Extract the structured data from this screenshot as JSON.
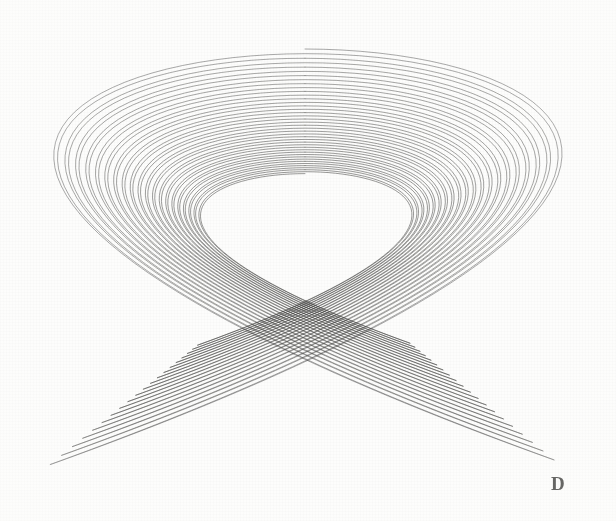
{
  "figure": {
    "label": "D",
    "background_color": "#fdfdfc",
    "ink_color": "#3b3b39",
    "width": 616,
    "height": 521
  },
  "chart_data": {
    "type": "line",
    "subtitle": "",
    "xlabel": "",
    "ylabel": "",
    "annotations": [
      "D"
    ],
    "legend_position": "none",
    "grid": false,
    "xlim": [
      -1.08,
      1.08
    ],
    "ylim": [
      -1.08,
      1.08
    ],
    "axis_visible": false,
    "tick_labels_x": [],
    "tick_labels_y": [],
    "canvas": {
      "center_x": 305,
      "center_y": 258,
      "radius_x": 258,
      "radius_y": 209,
      "bbox": [
        47,
        40,
        563,
        456
      ]
    },
    "parameters": {
      "freq_x": 3.0,
      "freq_y": 2.0,
      "phase_x_deg": 0,
      "phase_y_deg": 90,
      "damping": 0.0042,
      "phase_drift_deg": 0.0,
      "turns": 20,
      "samples_per_turn": 260,
      "line_width": 0.85,
      "stroke_opacity": 0.62
    },
    "series": [
      {
        "name": "pendulum-x",
        "frequency": 3.0,
        "phase_deg": 0,
        "amplitude": 1.0,
        "damping": 0.0042
      },
      {
        "name": "pendulum-y",
        "frequency": 2.0,
        "phase_deg": 90,
        "amplitude": 1.0,
        "damping": 0.0042
      }
    ],
    "nodes": [
      {
        "name": "center-crossing",
        "x": 300,
        "y": 262
      },
      {
        "name": "left-crossing",
        "x": 96,
        "y": 256
      },
      {
        "name": "right-crossing",
        "x": 508,
        "y": 262
      }
    ],
    "loop_count": 20,
    "values": [],
    "categories": []
  }
}
